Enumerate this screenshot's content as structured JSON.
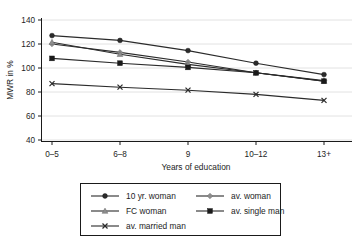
{
  "chart_data": {
    "type": "line",
    "title": "",
    "xlabel": "Years of education",
    "ylabel": "MWR in %",
    "categories": [
      "0–5",
      "6–8",
      "9",
      "10–12",
      "13+"
    ],
    "ylim": [
      40,
      140
    ],
    "yticks": [
      40,
      60,
      80,
      100,
      120,
      140
    ],
    "grid": true,
    "legend_position": "bottom",
    "series": [
      {
        "name": "10 yr. woman",
        "marker": "circle",
        "color": "#2b2b2b",
        "values": [
          127,
          123,
          114.5,
          104,
          94.5
        ]
      },
      {
        "name": "av. woman",
        "marker": "diamond",
        "color": "#8d8d8d",
        "values": [
          120,
          113,
          105,
          96,
          89.5
        ]
      },
      {
        "name": "FC woman",
        "marker": "triangle",
        "color": "#8d8d8d",
        "values": [
          121.5,
          111.5,
          103,
          96,
          89
        ]
      },
      {
        "name": "av. single man",
        "marker": "square",
        "color": "#1a1a1a",
        "values": [
          108,
          104,
          100.5,
          96,
          89
        ]
      },
      {
        "name": "av. married man",
        "marker": "x",
        "color": "#2b2b2b",
        "values": [
          87,
          84,
          81.5,
          78,
          73
        ]
      }
    ]
  },
  "legend": {
    "entries": [
      {
        "label": "10 yr. woman"
      },
      {
        "label": "av. woman"
      },
      {
        "label": "FC woman"
      },
      {
        "label": "av. single man"
      },
      {
        "label": "av. married man"
      }
    ]
  },
  "colors": {
    "axis": "#1a1a1a",
    "grid": "#e2e2e2",
    "legend_border": "#1a1a1a",
    "background": "#ffffff"
  }
}
